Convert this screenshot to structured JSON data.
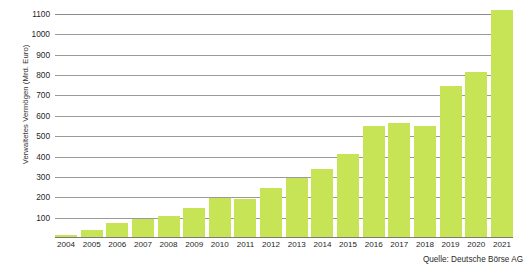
{
  "chart_data": {
    "type": "bar",
    "title": "",
    "subtitle": "",
    "xlabel": "",
    "ylabel": "Verwaltetes Vermögen (Mrd. Euro)",
    "ylim": [
      0,
      1100
    ],
    "ytick_step": 100,
    "yticks": [
      "1100",
      "1000",
      "900",
      "800",
      "700",
      "600",
      "500",
      "400",
      "300",
      "200",
      "100"
    ],
    "ytick_values": [
      1100,
      1000,
      900,
      800,
      700,
      600,
      500,
      400,
      300,
      200,
      100
    ],
    "grid": true,
    "legend": null,
    "legend_position": "none",
    "bar_color": "#c7e356",
    "categories": [
      "2004",
      "2005",
      "2006",
      "2007",
      "2008",
      "2009",
      "2010",
      "2011",
      "2012",
      "2013",
      "2014",
      "2015",
      "2016",
      "2017",
      "2018",
      "2019",
      "2020",
      "2021"
    ],
    "values": [
      15,
      40,
      75,
      95,
      110,
      145,
      195,
      190,
      245,
      295,
      340,
      415,
      550,
      565,
      550,
      745,
      815,
      1120
    ],
    "series": [
      {
        "name": "Verwaltetes Vermögen",
        "values": [
          15,
          40,
          75,
          95,
          110,
          145,
          195,
          190,
          245,
          295,
          340,
          415,
          550,
          565,
          550,
          745,
          815,
          1120
        ]
      }
    ],
    "annotations": [
      "Quelle: Deutsche Börse AG"
    ]
  },
  "source_note": "Quelle: Deutsche Börse AG"
}
